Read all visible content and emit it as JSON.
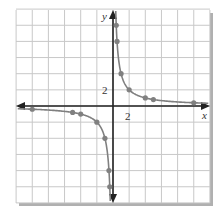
{
  "chart_data": {
    "type": "line",
    "title": "",
    "function": "y = 4/x",
    "xlabel": "x",
    "ylabel": "y",
    "tick_labels": {
      "x": "2",
      "y": "2"
    },
    "grid_step": 2,
    "xlim": [
      -12,
      12
    ],
    "ylim": [
      -12,
      12
    ],
    "grid": true,
    "series": [
      {
        "name": "branch-positive",
        "points": [
          [
            0.4,
            10
          ],
          [
            0.5,
            8
          ],
          [
            1,
            4
          ],
          [
            2,
            2
          ],
          [
            4,
            1
          ],
          [
            5,
            0.8
          ],
          [
            10,
            0.4
          ]
        ]
      },
      {
        "name": "branch-negative",
        "points": [
          [
            -10,
            -0.4
          ],
          [
            -5,
            -0.8
          ],
          [
            -4,
            -1
          ],
          [
            -2,
            -2
          ],
          [
            -1,
            -4
          ],
          [
            -0.5,
            -8
          ],
          [
            -0.4,
            -10
          ]
        ]
      }
    ],
    "colors": {
      "curve": "#808080",
      "axis": "#222222",
      "grid": "#c8c8c8",
      "frame_shadow": "#b0b0b0"
    }
  }
}
